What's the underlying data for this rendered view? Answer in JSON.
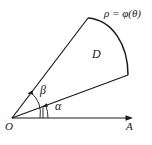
{
  "figure": {
    "background_color": "#ffffff",
    "stroke_color": "#1a1a1a",
    "labels": {
      "curve_equation": "ρ = φ(θ)",
      "region": "D",
      "angle_outer": "β",
      "angle_inner": "α",
      "origin": "O",
      "axis_end": "A"
    },
    "geometry": {
      "origin": [
        12,
        118
      ],
      "axis_end": [
        133,
        118
      ],
      "inner_ray_end": [
        128,
        75
      ],
      "outer_ray_end": [
        88,
        18
      ],
      "curve_start": [
        88,
        18
      ],
      "curve_end": [
        128,
        75
      ],
      "curve_control": [
        126,
        28
      ],
      "alpha_arc_radius": 36,
      "beta_arc_radius": 28,
      "tick_x": 43
    }
  }
}
